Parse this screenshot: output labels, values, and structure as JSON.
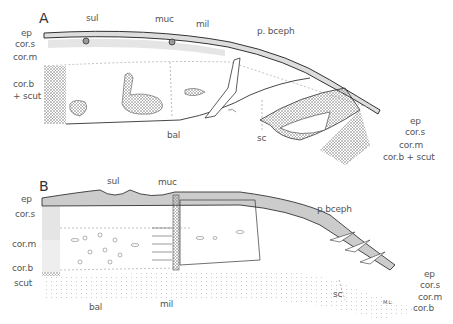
{
  "figure": {
    "panels": [
      {
        "id": "A",
        "label": "A",
        "left_labels": [
          "ep",
          "cor.s",
          "cor.m",
          "cor.b",
          "+ scut"
        ],
        "top_labels": [
          "sul",
          "muc",
          "mil",
          "p. bceph"
        ],
        "bottom_labels": [
          "bal",
          "sc"
        ],
        "right_labels": [
          "ep",
          "cor.s",
          "cor.m",
          "cor.b + scut"
        ]
      },
      {
        "id": "B",
        "label": "B",
        "left_labels": [
          "ep",
          "cor.s",
          "cor.m",
          "cor.b",
          "scut"
        ],
        "top_labels": [
          "sul",
          "muc",
          "p.bceph"
        ],
        "bottom_labels": [
          "bal",
          "mil",
          "sc"
        ],
        "right_labels": [
          "ep",
          "cor.s",
          "cor.m",
          "cor.b"
        ],
        "signature": "M.L."
      }
    ]
  }
}
